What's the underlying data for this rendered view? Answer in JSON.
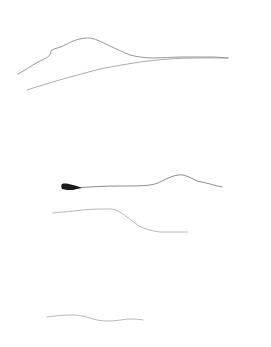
{
  "canvas": {
    "width": 271,
    "height": 347,
    "background_color": "#ffffff",
    "title": "Minimalist line sketch"
  },
  "palette": {
    "ink_light": "#b4b4b4",
    "ink_mid": "#8e8e8e",
    "ink_dark": "#6f6f6f",
    "ink_black": "#1a1a1a",
    "background": "#ffffff"
  },
  "groups": [
    {
      "name": "upper-ridge-group",
      "label": "Upper ridge group",
      "strokes": [
        {
          "name": "upper-ridge-crest-line",
          "label": "Upper ridge crest line",
          "color": "#7d7d7d",
          "width": 0.85,
          "opacity": 0.95,
          "d": "M18,74 C24,71 31,66 38,62 C44,59 47,58 49,56 C51,54 50,52 52,50 C55,48 60,48 65,45 C72,41 80,38 88,38 C95,38 101,42 108,45 C116,49 123,52 130,55 C138,57 146,58 154,58 C163,58 172,57 181,57 C192,57 203,57 212,57 C219,57 224,58 228,58"
        },
        {
          "name": "upper-ridge-base-line",
          "label": "Upper ridge base line",
          "color": "#8e8e8e",
          "width": 0.8,
          "opacity": 0.92,
          "d": "M27,90 C36,87 46,84 56,81 C70,77 85,73 100,69 C116,66 132,63 148,61 C165,59 182,58 198,58 C210,58 220,58 228,58"
        }
      ]
    },
    {
      "name": "middle-ridge-group",
      "label": "Middle ridge group",
      "strokes": [
        {
          "name": "middle-upper-ridge-line",
          "label": "Middle upper ridge line",
          "color": "#6f6f6f",
          "width": 0.85,
          "opacity": 0.95,
          "d": "M72,188 C88,187 104,186 120,186 C132,186 142,186 150,185 C156,184 158,183 162,181 C168,178 172,176 178,175 C183,174 186,176 189,177 C192,178 194,180 197,181 C200,182 203,182 206,183 C211,184 216,186 222,187"
        },
        {
          "name": "middle-lower-ridge-line",
          "label": "Middle lower ridge line",
          "color": "#9a9a9a",
          "width": 0.8,
          "opacity": 0.9,
          "d": "M53,213 C63,212 73,211 83,210 C92,209 101,209 110,209 C114,209 116,210 120,212 C126,216 132,221 139,226 C145,229 152,231 160,232 C170,232 180,232 188,232"
        }
      ]
    },
    {
      "name": "bottom-ridge-group",
      "label": "Bottom ridge group",
      "strokes": [
        {
          "name": "bottom-ridge-line",
          "label": "Bottom ridge line",
          "color": "#9a9a9a",
          "width": 0.8,
          "opacity": 0.9,
          "d": "M47,317 C55,316 63,315 71,315 C78,315 84,316 90,318 C96,320 101,321 107,321 C114,321 121,320 128,319 C134,319 139,319 143,320"
        }
      ]
    }
  ],
  "ink_marks": [
    {
      "name": "dark-brush-wedge",
      "label": "Dark tapered brush wedge",
      "color": "#1a1a1a",
      "d": "M62,184 C65,183 69,184 73,185 C77,186 80,187 82,188 C80,188 77,189 73,190 C69,190 65,190 62,189 C61,187 61,185 62,184 Z"
    }
  ]
}
